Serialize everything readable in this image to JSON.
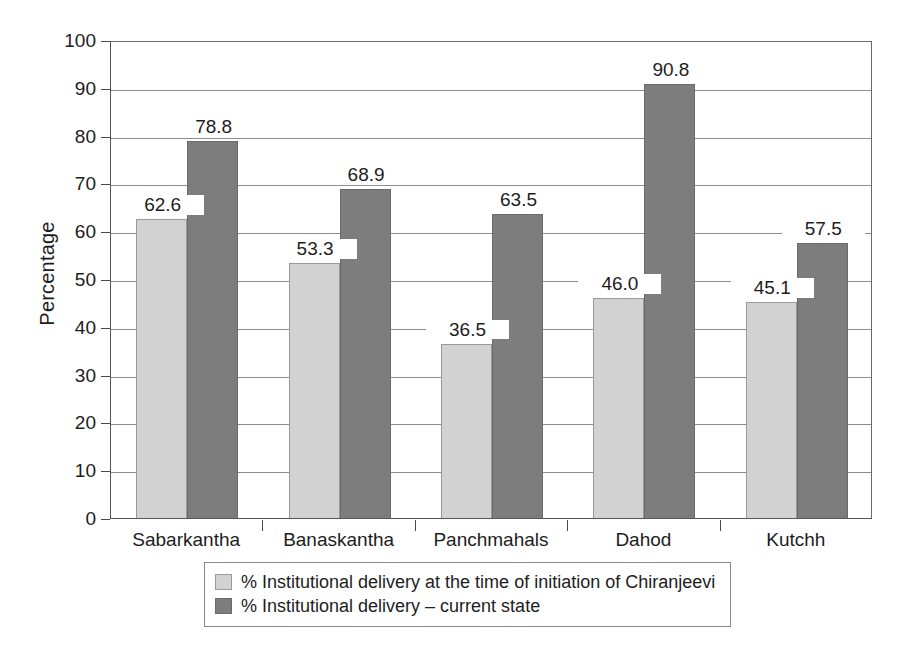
{
  "chart_data": {
    "type": "bar",
    "title": "",
    "subtitle": "",
    "xlabel": "",
    "ylabel": "Percentage",
    "ylim": [
      0,
      100
    ],
    "ytick_step": 10,
    "yticks": [
      "0",
      "10",
      "20",
      "30",
      "40",
      "50",
      "60",
      "70",
      "80",
      "90",
      "100"
    ],
    "grid": true,
    "legend_position": "bottom",
    "categories": [
      "Sabarkantha",
      "Banaskantha",
      "Panchmahals",
      "Dahod",
      "Kutchh"
    ],
    "series": [
      {
        "name": "% Institutional delivery at the time of initiation of Chiranjeevi",
        "color": "#d2d2d2",
        "values": [
          62.6,
          53.3,
          36.5,
          46.0,
          45.1
        ],
        "labels": [
          "62.6",
          "53.3",
          "36.5",
          "46.0",
          "45.1"
        ]
      },
      {
        "name": "% Institutional delivery – current state",
        "color": "#7d7d7d",
        "values": [
          78.8,
          68.9,
          63.5,
          90.8,
          57.5
        ],
        "labels": [
          "78.8",
          "68.9",
          "63.5",
          "90.8",
          "57.5"
        ]
      }
    ]
  },
  "legend": {
    "items": [
      {
        "label": "% Institutional delivery at the time of initiation of Chiranjeevi",
        "swatch": "light-gray-swatch"
      },
      {
        "label": "% Institutional delivery – current state",
        "swatch": "dark-gray-swatch"
      }
    ]
  },
  "colors": {
    "series_light": "#d2d2d2",
    "series_dark": "#7d7d7d",
    "gridline": "#8d8d8d",
    "axis": "#555555",
    "text": "#1d1d1d",
    "background": "#ffffff"
  }
}
